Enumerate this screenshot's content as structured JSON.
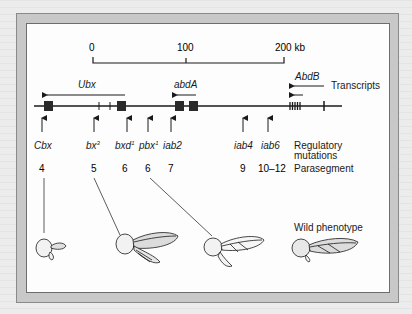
{
  "figure": {
    "scale_bar": {
      "ticks": [
        {
          "label": "0",
          "kb": 0
        },
        {
          "label": "100",
          "kb": 100
        },
        {
          "label": "200 kb",
          "kb": 200
        }
      ]
    },
    "transcripts": {
      "label": "Transcripts",
      "genes": [
        {
          "name": "Ubx",
          "direction": "left"
        },
        {
          "name": "abdA",
          "direction": "left"
        },
        {
          "name": "AbdB",
          "direction": "left",
          "arrows": 2
        }
      ]
    },
    "regulatory_mutations": {
      "label_line1": "Regulatory",
      "label_line2": "mutations",
      "items": [
        {
          "name": "Cbx",
          "sup": ""
        },
        {
          "name": "bx",
          "sup": "3"
        },
        {
          "name": "bxd",
          "sup": "1"
        },
        {
          "name": "pbx",
          "sup": "1"
        },
        {
          "name": "iab2",
          "sup": ""
        },
        {
          "name": "iab4",
          "sup": ""
        },
        {
          "name": "iab6",
          "sup": ""
        }
      ]
    },
    "parasegment": {
      "label": "Parasegment",
      "values": [
        "4",
        "5",
        "6",
        "6",
        "7",
        "9",
        "10–12"
      ]
    },
    "phenotypes": {
      "wild_label": "Wild phenotype",
      "flies": [
        {
          "id": "fly-cbx",
          "linked_parasegment": "4"
        },
        {
          "id": "fly-bx3",
          "linked_parasegment": "5"
        },
        {
          "id": "fly-pbx1",
          "linked_parasegment": "6"
        },
        {
          "id": "fly-wild",
          "linked_parasegment": ""
        }
      ]
    },
    "colors": {
      "frame": "#c8c8c8",
      "line": "#1a1a1a",
      "exon": "#2a2a2a",
      "wing_fill": "#dcdcdc"
    }
  }
}
